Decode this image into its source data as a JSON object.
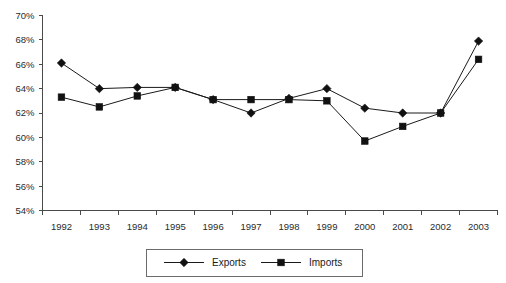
{
  "chart_data": {
    "type": "line",
    "title": "",
    "subtitle": "",
    "xlabel": "",
    "ylabel": "",
    "categories": [
      "1992",
      "1993",
      "1994",
      "1995",
      "1996",
      "1997",
      "1998",
      "1999",
      "2000",
      "2001",
      "2002",
      "2003"
    ],
    "series": [
      {
        "name": "Exports",
        "marker": "diamond",
        "color": "#111111",
        "values": [
          66.1,
          64.0,
          64.1,
          64.1,
          63.1,
          62.0,
          63.2,
          64.0,
          62.4,
          62.0,
          62.0,
          67.9
        ]
      },
      {
        "name": "Imports",
        "marker": "square",
        "color": "#111111",
        "values": [
          63.3,
          62.5,
          63.4,
          64.1,
          63.1,
          63.1,
          63.1,
          63.0,
          59.7,
          60.9,
          62.0,
          66.4
        ]
      }
    ],
    "ylim": [
      54,
      70
    ],
    "ytick_step": 2,
    "ytick_labels": [
      "54%",
      "56%",
      "58%",
      "60%",
      "62%",
      "64%",
      "66%",
      "68%",
      "70%"
    ],
    "ytick_values": [
      54,
      56,
      58,
      60,
      62,
      64,
      66,
      68,
      70
    ],
    "grid": false,
    "legend_position": "bottom-center",
    "legend_entries": [
      "Exports",
      "Imports"
    ],
    "axis_color": "#4a4a4a",
    "background_color": "#ffffff"
  },
  "legend": {
    "exports_label": "Exports",
    "imports_label": "Imports"
  }
}
